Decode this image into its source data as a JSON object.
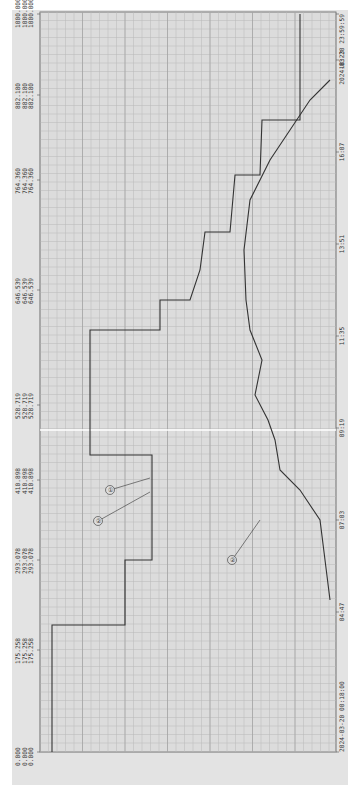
{
  "chart_data": {
    "type": "line",
    "title": "",
    "xlabel": "Time",
    "ylabel": "",
    "orientation": "rotated-90",
    "grid": true,
    "colors": {
      "background": "#dcdcdc",
      "grid": "#b4b4b4",
      "line": "#333333",
      "page": "#ffffff"
    },
    "y_ticks": [
      {
        "value": 1000.0,
        "label": "1000.000 1000.000 1000.000"
      },
      {
        "value": 882.18,
        "label": "882.180 882.180 882.180"
      },
      {
        "value": 764.36,
        "label": "764.360 764.360 764.360"
      },
      {
        "value": 646.539,
        "label": "646.539 646.539 646.539"
      },
      {
        "value": 528.719,
        "label": "528.719 528.719 528.719"
      },
      {
        "value": 410.898,
        "label": "410.898 410.898 410.898"
      },
      {
        "value": 293.078,
        "label": "293.078 293.078 293.078"
      },
      {
        "value": 175.258,
        "label": "175.258 175.258 175.258"
      },
      {
        "value": 0.0,
        "label": "0.000 0.000 0.000"
      }
    ],
    "x_ticks": [
      "2024-03-20 00:18:00",
      "04:47",
      "07:03",
      "09:19",
      "11:35",
      "13:51",
      "16:07",
      "18:23",
      "2024-03-20 23:59:59"
    ],
    "ylim": [
      0,
      1000
    ],
    "series": [
      {
        "name": "①",
        "x": [
          "00:18",
          "02:30",
          "02:30",
          "04:47",
          "04:47",
          "06:00",
          "06:00",
          "07:50",
          "08:40",
          "09:19",
          "10:00",
          "11:00",
          "11:35",
          "12:20",
          "13:00",
          "13:51",
          "14:40",
          "15:30",
          "16:07",
          "17:00",
          "17:30",
          "18:00",
          "19:00",
          "19:00",
          "23:59"
        ],
        "values": [
          1000,
          1000,
          646,
          646,
          800,
          800,
          864,
          864,
          830,
          820,
          790,
          760,
          730,
          710,
          700,
          690,
          660,
          640,
          620,
          600,
          580,
          575,
          560,
          410,
          410
        ]
      },
      {
        "name": "②",
        "x": [
          "00:18",
          "06:30",
          "07:03",
          "07:50",
          "09:19",
          "10:30",
          "11:35",
          "12:30",
          "13:51",
          "16:07",
          "17:30",
          "18:23",
          "19:30",
          "23:59"
        ],
        "values": [
          0,
          0,
          20,
          120,
          180,
          230,
          280,
          300,
          310,
          260,
          200,
          140,
          40,
          0
        ]
      }
    ],
    "annotations": [
      {
        "text": "①",
        "target": "series 1"
      },
      {
        "text": "②",
        "target": "series 1 (secondary)"
      },
      {
        "text": "②",
        "target": "series 2"
      }
    ]
  }
}
